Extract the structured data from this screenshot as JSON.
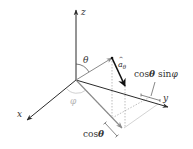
{
  "diagram": {
    "type": "3d-spherical-unit-vector-projection",
    "width": 193,
    "height": 149,
    "colors": {
      "axis": "#2a2a2a",
      "r_vector": "#8a8a8a",
      "a_theta": "#111111",
      "projection": "#8a8a8a",
      "dotted": "#9a9a9a",
      "phi_label": "#b5b5b5",
      "label": "#333333"
    },
    "origin": [
      76,
      80
    ],
    "axes": [
      {
        "name": "z",
        "label": "z",
        "tip": [
          76,
          10
        ],
        "label_pos": [
          81,
          15
        ]
      },
      {
        "name": "x",
        "label": "x",
        "tip": [
          27,
          120
        ],
        "label_pos": [
          17,
          117
        ]
      },
      {
        "name": "y",
        "label": "y",
        "tip": [
          168,
          107
        ],
        "label_pos": [
          163,
          101
        ]
      }
    ],
    "r_vector": {
      "from": [
        76,
        80
      ],
      "to": [
        112,
        58
      ]
    },
    "a_theta": {
      "from": [
        112,
        58
      ],
      "to": [
        125,
        86
      ],
      "label_base": "a",
      "label_sub": "θ"
    },
    "projection_vector": {
      "from": [
        76,
        80
      ],
      "to": [
        122,
        128
      ]
    },
    "angles": {
      "theta": {
        "label": "θ",
        "label_pos": [
          83,
          63
        ]
      },
      "phi": {
        "label": "φ",
        "label_pos": [
          70,
          104
        ]
      }
    },
    "annotations": {
      "cos_theta_sin_phi": {
        "text_cos": "cos",
        "text_theta": "θ",
        "text_sin": "sin",
        "text_phi": "φ",
        "pos": [
          134,
          77
        ]
      },
      "cos_theta": {
        "text_cos": "cos",
        "text_theta": "θ",
        "pos": [
          83,
          137
        ]
      }
    }
  }
}
